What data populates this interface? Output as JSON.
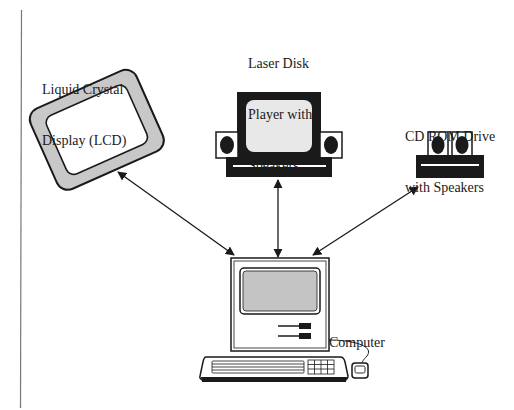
{
  "diagram": {
    "title": "",
    "nodes": [
      {
        "id": "lcd",
        "label_line1": "Liquid Crystal",
        "label_line2": "Display (LCD)"
      },
      {
        "id": "laser",
        "label_line1": "Laser Disk",
        "label_line2": "Player with",
        "label_line3": "Speakers"
      },
      {
        "id": "cdrom",
        "label_line1": "CD ROM Drive",
        "label_line2": "with Speakers"
      },
      {
        "id": "computer",
        "label_line1": "Computer"
      }
    ],
    "edges": [
      {
        "from": "computer",
        "to": "lcd",
        "type": "bidirectional-arrow"
      },
      {
        "from": "computer",
        "to": "laser",
        "type": "bidirectional-arrow"
      },
      {
        "from": "computer",
        "to": "cdrom",
        "type": "bidirectional-arrow"
      }
    ],
    "colors": {
      "ink": "#1a1a1a",
      "lcd_frame": "#c8c8c8",
      "screen_gray": "#c4c4c4",
      "screen_light": "#e8e8e8",
      "margin_line": "#777777"
    }
  }
}
